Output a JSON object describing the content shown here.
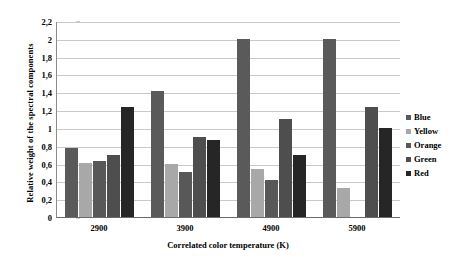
{
  "chart_data": {
    "type": "bar",
    "title": "",
    "xlabel": "Correlated color temperature (K)",
    "ylabel": "Relative weight of the spectral components",
    "categories": [
      "2900",
      "3900",
      "4900",
      "5900"
    ],
    "series": [
      {
        "name": "Blue",
        "color": "#5a5a5a",
        "values": [
          0.77,
          1.41,
          2.0,
          2.0
        ]
      },
      {
        "name": "Yellow",
        "color": "#a8a8a8",
        "values": [
          0.61,
          0.59,
          0.54,
          0.33
        ]
      },
      {
        "name": "Orange",
        "color": "#585858",
        "values": [
          0.63,
          0.51,
          0.41,
          0.0
        ]
      },
      {
        "name": "Green",
        "color": "#4e4e4e",
        "values": [
          0.7,
          0.9,
          1.1,
          1.24
        ]
      },
      {
        "name": "Red",
        "color": "#262626",
        "values": [
          1.24,
          0.86,
          0.7,
          1.0
        ]
      }
    ],
    "ylim": [
      0,
      2.2
    ],
    "ytick_values": [
      0,
      0.2,
      0.4,
      0.6,
      0.8,
      1.0,
      1.2,
      1.4,
      1.6,
      1.8,
      2.0,
      2.2
    ],
    "ytick_labels": [
      "0",
      "0,2",
      "0,4",
      "0,6",
      "0,8",
      "1",
      "1,2",
      "1,4",
      "1,6",
      "1,8",
      "2",
      "2,2"
    ],
    "grid": true,
    "legend_position": "right"
  },
  "legend": {
    "items": [
      {
        "label": "Blue"
      },
      {
        "label": "Yellow"
      },
      {
        "label": "Orange"
      },
      {
        "label": "Green"
      },
      {
        "label": "Red"
      }
    ]
  }
}
